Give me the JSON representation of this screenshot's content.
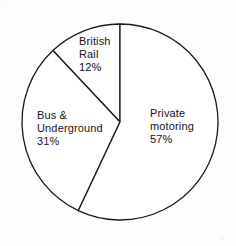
{
  "chart_data": {
    "type": "pie",
    "title": "",
    "labels": [
      "Private motoring",
      "Bus & Underground",
      "British Rail"
    ],
    "values": [
      57,
      31,
      12
    ],
    "unit": "%",
    "legend": "none",
    "label_placement": "inside-slice",
    "colors": {
      "slice_fill": "#ffffff",
      "slice_stroke": "#1a1a1a",
      "text": "#141414",
      "background": "#fdfdfd"
    },
    "geometry": {
      "center_x": 120,
      "center_y": 122,
      "radius": 98,
      "start_angle_deg": 0,
      "direction": "counterclockwise"
    },
    "slices": [
      {
        "name": "british-rail",
        "label_lines": [
          "British",
          "Rail",
          "12%"
        ],
        "value": 12,
        "value_text": "12%",
        "start_angle_deg": 0,
        "end_angle_deg": 43.2
      },
      {
        "name": "bus-underground",
        "label_lines": [
          "Bus &",
          "Underground",
          "31%"
        ],
        "value": 31,
        "value_text": "31%",
        "start_angle_deg": 43.2,
        "end_angle_deg": 154.8
      },
      {
        "name": "private-motoring",
        "label_lines": [
          "Private",
          "motoring",
          "57%"
        ],
        "value": 57,
        "value_text": "57%",
        "start_angle_deg": 154.8,
        "end_angle_deg": 360
      }
    ]
  },
  "labels": {
    "british_rail": {
      "line1": "British",
      "line2": "Rail",
      "line3": "12%"
    },
    "bus_underground": {
      "line1": "Bus &",
      "line2": "Underground",
      "line3": "31%"
    },
    "private_motoring": {
      "line1": "Private",
      "line2": "motoring",
      "line3": "57%"
    }
  }
}
